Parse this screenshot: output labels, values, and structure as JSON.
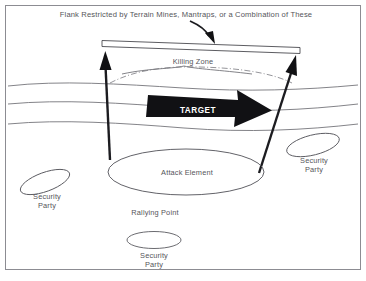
{
  "diagram": {
    "title_caption": "Flank Restricted by Terrain Mines, Mantraps, or a Combination of These",
    "labels": {
      "killing_zone": "Killing Zone",
      "target": "TARGET",
      "attack_element": "Attack Element",
      "rallying_point": "Rallying Point",
      "security_left_line1": "Security",
      "security_left_line2": "Party",
      "security_right_line1": "Security",
      "security_right_line2": "Party",
      "security_bottom_line1": "Security",
      "security_bottom_line2": "Party"
    },
    "colors": {
      "background": "#ffffff",
      "text": "#55555a",
      "line": "#6d6d72",
      "solid_fill": "#111114",
      "frame": "#8c8c92",
      "target_text": "#ffffff"
    },
    "elements": {
      "barrier_name": "flank-barrier-bar",
      "pointer_name": "caption-pointer-arrow",
      "left_arrow_name": "left-assault-arrow",
      "right_arrow_name": "right-assault-arrow",
      "target_arrow_name": "target-movement-arrow"
    }
  }
}
